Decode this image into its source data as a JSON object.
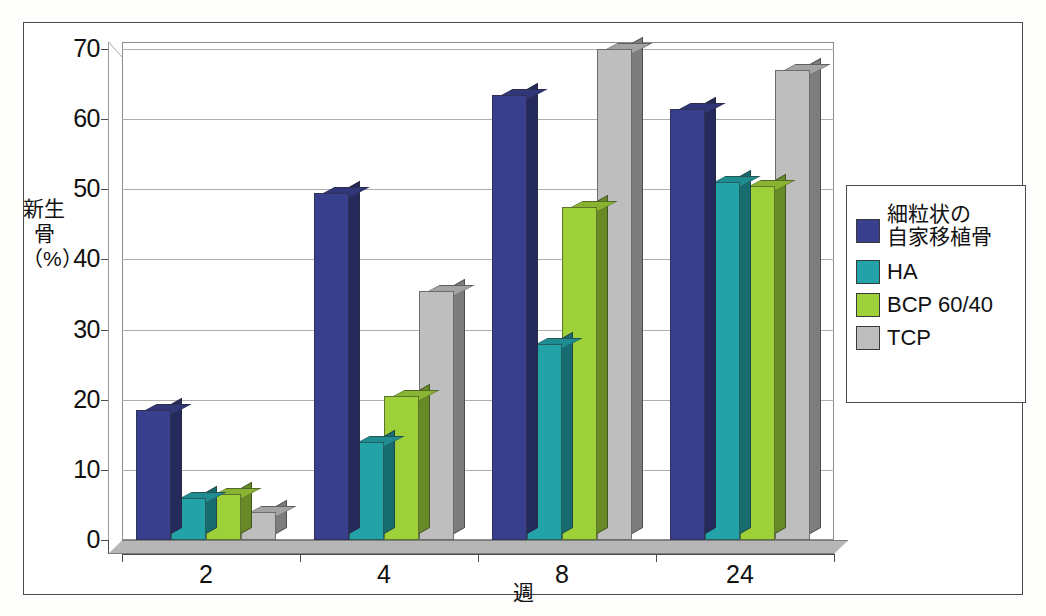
{
  "chart_data": {
    "type": "bar",
    "title": "",
    "xlabel": "週",
    "ylabel": "新生骨（%）",
    "ylabel_lines": [
      "新生",
      "骨",
      "（%）"
    ],
    "categories": [
      "2",
      "4",
      "8",
      "24"
    ],
    "ylim": [
      0,
      70
    ],
    "yticks": [
      0,
      10,
      20,
      30,
      40,
      50,
      60,
      70
    ],
    "ytick_labels": [
      "0",
      "10",
      "20",
      "30",
      "40",
      "50",
      "60",
      "70"
    ],
    "grid": true,
    "legend_position": "right",
    "style": "3d-clustered-column",
    "series": [
      {
        "name": "細粒状の自家移植骨",
        "name_lines": [
          "細粒状の",
          "自家移植骨"
        ],
        "color": "#383f8c",
        "values": [
          18.5,
          49.5,
          63.5,
          61.5
        ]
      },
      {
        "name": "HA",
        "name_lines": [
          "HA"
        ],
        "color": "#23a3a8",
        "values": [
          6,
          14,
          28,
          51
        ]
      },
      {
        "name": "BCP 60/40",
        "name_lines": [
          "BCP 60/40"
        ],
        "color": "#9ed139",
        "values": [
          6.5,
          20.5,
          47.5,
          50.5
        ]
      },
      {
        "name": "TCP",
        "name_lines": [
          "TCP"
        ],
        "color": "#bebebe",
        "values": [
          4,
          35.5,
          70,
          67
        ]
      }
    ]
  },
  "legend": {
    "entries": [
      {
        "label": "細粒状の自家移植骨",
        "line1": "細粒状の",
        "line2": "自家移植骨",
        "color": "#383f8c"
      },
      {
        "label": "HA",
        "line1": "HA",
        "line2": "",
        "color": "#23a3a8"
      },
      {
        "label": "BCP 60/40",
        "line1": "BCP 60/40",
        "line2": "",
        "color": "#9ed139"
      },
      {
        "label": "TCP",
        "line1": "TCP",
        "line2": "",
        "color": "#bebebe"
      }
    ]
  },
  "axes": {
    "y_title_line1": "新生",
    "y_title_line2": "骨",
    "y_title_line3": "（%）",
    "x_title": "週",
    "y_ticks": [
      "70",
      "60",
      "50",
      "40",
      "30",
      "20",
      "10",
      "0"
    ],
    "x_ticks": [
      "2",
      "4",
      "8",
      "24"
    ]
  },
  "colors": {
    "series_navy": "#383f8c",
    "series_teal": "#23a3a8",
    "series_green": "#9ed139",
    "series_gray": "#bebebe",
    "grid": "#aeaeae",
    "axis": "#4a4a4a",
    "background": "#ffffff"
  }
}
